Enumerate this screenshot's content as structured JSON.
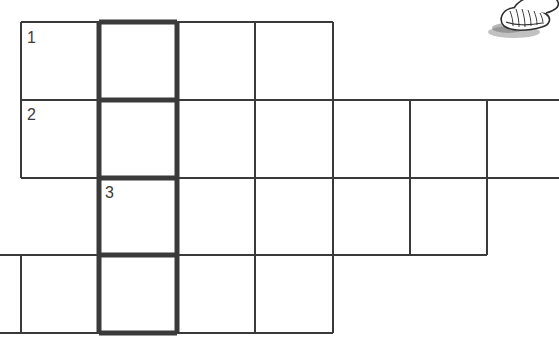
{
  "page": {
    "kind": "crossword-puzzle-scan",
    "width": 559,
    "height": 337,
    "background_color": "#ffffff"
  },
  "grid": {
    "line_color": "#3a3a3a",
    "thin_line_width": 2,
    "bold_line_width": 5,
    "cell_size": 78,
    "x_positions": [
      0,
      21,
      99,
      177,
      255,
      333,
      410,
      487,
      559
    ],
    "y_positions": [
      22,
      100,
      178,
      255,
      333
    ],
    "rows": [
      {
        "index": 1,
        "x_start": 21,
        "x_end": 333,
        "y_top": 22,
        "y_bottom": 100,
        "cells": 4,
        "clipped": "none"
      },
      {
        "index": 2,
        "x_start": 21,
        "x_end": 559,
        "y_top": 100,
        "y_bottom": 178,
        "cells": 7,
        "clipped": "right"
      },
      {
        "index": 3,
        "x_start": 99,
        "x_end": 487,
        "y_top": 178,
        "y_bottom": 255,
        "cells": 5,
        "clipped": "none"
      },
      {
        "index": 4,
        "x_start": 0,
        "x_end": 333,
        "y_top": 255,
        "y_bottom": 333,
        "cells": 4,
        "clipped": "left"
      }
    ],
    "bold_column": {
      "x_start": 99,
      "x_end": 177,
      "y_start": 22,
      "y_end": 333,
      "description": "highlighted vertical answer column spanning all four rows"
    }
  },
  "clues": [
    {
      "number": "1",
      "x": 27,
      "y": 30
    },
    {
      "number": "2",
      "x": 27,
      "y": 107
    },
    {
      "number": "3",
      "x": 105,
      "y": 185
    }
  ],
  "clipart": {
    "name": "hand-shell-illustration",
    "description": "small grayscale line drawing cropped by the top edge"
  }
}
